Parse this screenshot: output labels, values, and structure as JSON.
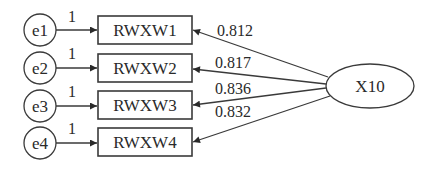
{
  "diagram": {
    "type": "structural-equation-model",
    "latent": {
      "label": "X10"
    },
    "errors": [
      {
        "label": "e1",
        "weight": "1"
      },
      {
        "label": "e2",
        "weight": "1"
      },
      {
        "label": "e3",
        "weight": "1"
      },
      {
        "label": "e4",
        "weight": "1"
      }
    ],
    "indicators": [
      {
        "label": "RWXW1",
        "loading": "0.812"
      },
      {
        "label": "RWXW2",
        "loading": "0.817"
      },
      {
        "label": "RWXW3",
        "loading": "0.836"
      },
      {
        "label": "RWXW4",
        "loading": "0.832"
      }
    ],
    "colors": {
      "stroke": "#3a3a3a",
      "text": "#2a2a2a",
      "background": "#ffffff"
    }
  }
}
